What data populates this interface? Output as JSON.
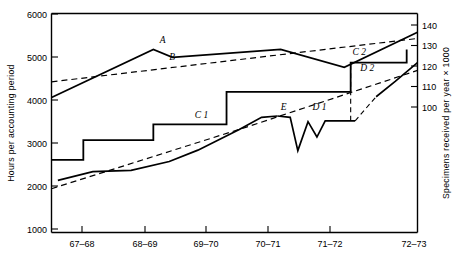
{
  "chart_data": {
    "type": "line",
    "title": "",
    "xlabel": "",
    "ylabel": "Hours per accounting period",
    "y2label": "Specimens received per year × 1000",
    "grid": false,
    "legend_position": "inline-labels",
    "categories": [
      "67–68",
      "68–69",
      "69–70",
      "70–71",
      "71–72",
      "72–73"
    ],
    "xtick_labels": [
      "67–68",
      "68–69",
      "69–70",
      "70–71",
      "71–72",
      "72–73"
    ],
    "ytick_labels": [
      "6000",
      "5000",
      "4000",
      "3000",
      "2000",
      "1000"
    ],
    "ytick_values": [
      6000,
      5000,
      4000,
      3000,
      2000,
      1000
    ],
    "ylim": [
      1000,
      6000
    ],
    "y2tick_labels": [
      "140",
      "130",
      "120",
      "110",
      "100"
    ],
    "y2tick_values": [
      140,
      130,
      120,
      110,
      100
    ],
    "y2lim": [
      92,
      146
    ],
    "xlim": [
      1967.25,
      1973.0
    ],
    "series": [
      {
        "name": "A",
        "label": "A",
        "style": "solid",
        "axis": "left",
        "label_x": 1968.95,
        "label_y": 5320,
        "x": [
          1967.25,
          1968.85,
          1969.15,
          1970.85,
          1971.85,
          1973.0
        ],
        "values": [
          4080,
          5180,
          5000,
          5180,
          4770,
          5570
        ]
      },
      {
        "name": "B",
        "label": "B",
        "style": "dashed",
        "axis": "left",
        "label_x": 1969.1,
        "label_y": 4940,
        "x": [
          1967.25,
          1973.0
        ],
        "values": [
          4440,
          5430
        ]
      },
      {
        "name": "C 1",
        "label": "C 1",
        "style": "step",
        "axis": "left",
        "label_x": 1969.5,
        "label_y": 3620,
        "x": [
          1967.25,
          1967.75,
          1967.75,
          1968.85,
          1968.85,
          1970.0,
          1970.0,
          1971.95
        ],
        "values": [
          2660,
          2660,
          3110,
          3110,
          3470,
          3470,
          4210,
          4210
        ]
      },
      {
        "name": "C 2",
        "label": "C 2",
        "style": "step",
        "axis": "left",
        "label_x": 1971.98,
        "label_y": 5050,
        "x": [
          1971.95,
          1971.95,
          1972.83,
          1972.83
        ],
        "values": [
          4210,
          4880,
          4880,
          5180
        ]
      },
      {
        "name": "E",
        "label": "E",
        "style": "solid",
        "axis": "left",
        "label_x": 1970.85,
        "label_y": 3800,
        "x": [
          1967.35,
          1967.9,
          1968.5,
          1969.1,
          1969.55,
          1970.2,
          1970.55,
          1970.8
        ],
        "values": [
          2190,
          2390,
          2420,
          2620,
          2880,
          3350,
          3630,
          3660
        ]
      },
      {
        "name": "D 1",
        "label": "D 1",
        "style": "solid",
        "axis": "left",
        "label_x": 1971.35,
        "label_y": 3800,
        "x": [
          1970.8,
          1971.0,
          1971.12,
          1971.28,
          1971.42,
          1971.55,
          1971.68,
          1972.02
        ],
        "values": [
          3660,
          3630,
          2870,
          3530,
          3180,
          3550,
          3550,
          3550
        ]
      },
      {
        "name": "D 2",
        "label": "D 2",
        "style": "solid",
        "axis": "left",
        "label_x": 1972.1,
        "label_y": 4690,
        "x": [
          1972.35,
          1972.65,
          1973.0
        ],
        "values": [
          4100,
          4450,
          4880
        ]
      },
      {
        "name": "lower-trend",
        "label": "",
        "style": "dashed",
        "axis": "left",
        "x": [
          1967.25,
          1970.3,
          1973.0
        ],
        "values": [
          2000,
          3400,
          4700
        ]
      },
      {
        "name": "D-riser",
        "label": "",
        "style": "dashed",
        "axis": "left",
        "x": [
          1972.02,
          1972.35
        ],
        "values": [
          3550,
          4100
        ]
      },
      {
        "name": "C2-riser",
        "label": "",
        "style": "dashed",
        "axis": "left",
        "x": [
          1971.95,
          1971.95
        ],
        "values": [
          3550,
          4880
        ]
      }
    ]
  },
  "axes": {
    "left_title": "Hours per accounting period",
    "right_title": "Specimens received per year × 1000",
    "left_ticks": [
      "6000",
      "5000",
      "4000",
      "3000",
      "2000",
      "1000"
    ],
    "right_ticks": [
      "140",
      "130",
      "120",
      "110",
      "100"
    ],
    "x_ticks": [
      "67–68",
      "68–69",
      "69–70",
      "70–71",
      "71–72",
      "72–73"
    ]
  },
  "labels": {
    "a": "A",
    "b": "B",
    "c1": "C 1",
    "c2": "C 2",
    "d1": "D 1",
    "d2": "D 2",
    "e": "E"
  },
  "colors": {
    "line": "#000000",
    "background": "#ffffff"
  }
}
